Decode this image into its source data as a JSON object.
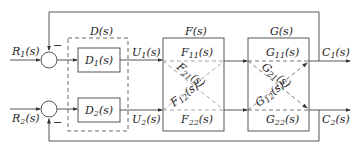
{
  "diagram": {
    "inputs": [
      {
        "name": "R",
        "sub": "1",
        "arg": "(s)"
      },
      {
        "name": "R",
        "sub": "2",
        "arg": "(s)"
      }
    ],
    "outputs": [
      {
        "name": "C",
        "sub": "1",
        "arg": "(s)"
      },
      {
        "name": "C",
        "sub": "2",
        "arg": "(s)"
      }
    ],
    "controller": {
      "title": "D(s)",
      "blocks": [
        {
          "name": "D",
          "sub": "1",
          "arg": "(s)"
        },
        {
          "name": "D",
          "sub": "2",
          "arg": "(s)"
        }
      ]
    },
    "signals": [
      {
        "name": "U",
        "sub": "1",
        "arg": "(s)"
      },
      {
        "name": "U",
        "sub": "2",
        "arg": "(s)"
      }
    ],
    "plant_f": {
      "title": "F(s)",
      "elements": [
        {
          "name": "F",
          "sub": "11",
          "arg": "(s)"
        },
        {
          "name": "F",
          "sub": "21",
          "arg": "(s)"
        },
        {
          "name": "F",
          "sub": "12",
          "arg": "(s)"
        },
        {
          "name": "F",
          "sub": "22",
          "arg": "(s)"
        }
      ]
    },
    "plant_g": {
      "title": "G(s)",
      "elements": [
        {
          "name": "G",
          "sub": "11",
          "arg": "(s)"
        },
        {
          "name": "G",
          "sub": "21",
          "arg": "(s)"
        },
        {
          "name": "G",
          "sub": "12",
          "arg": "(s)"
        },
        {
          "name": "G",
          "sub": "22",
          "arg": "(s)"
        }
      ]
    },
    "feedback_sign": "−",
    "colors": {
      "line": "#444444",
      "dashed": "#555555",
      "cross": "#999999"
    }
  }
}
